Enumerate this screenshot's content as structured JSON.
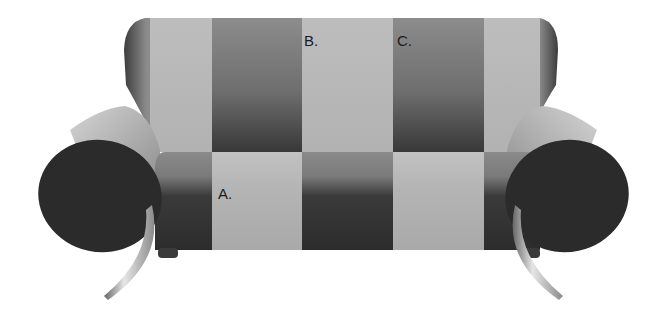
{
  "image": {
    "subject": "striped two-seat sofa illusion",
    "colors": {
      "background": "#ffffff",
      "light_stripe": "#b4b4b4",
      "mid_stripe_top": "#8e8e8e",
      "dark_stripe_bottom": "#2e2e2e",
      "arm_end": "#2a2a2a",
      "leg_metal": "#a8a8a8"
    },
    "labels": {
      "a": "A.",
      "b": "B.",
      "c": "C."
    }
  }
}
